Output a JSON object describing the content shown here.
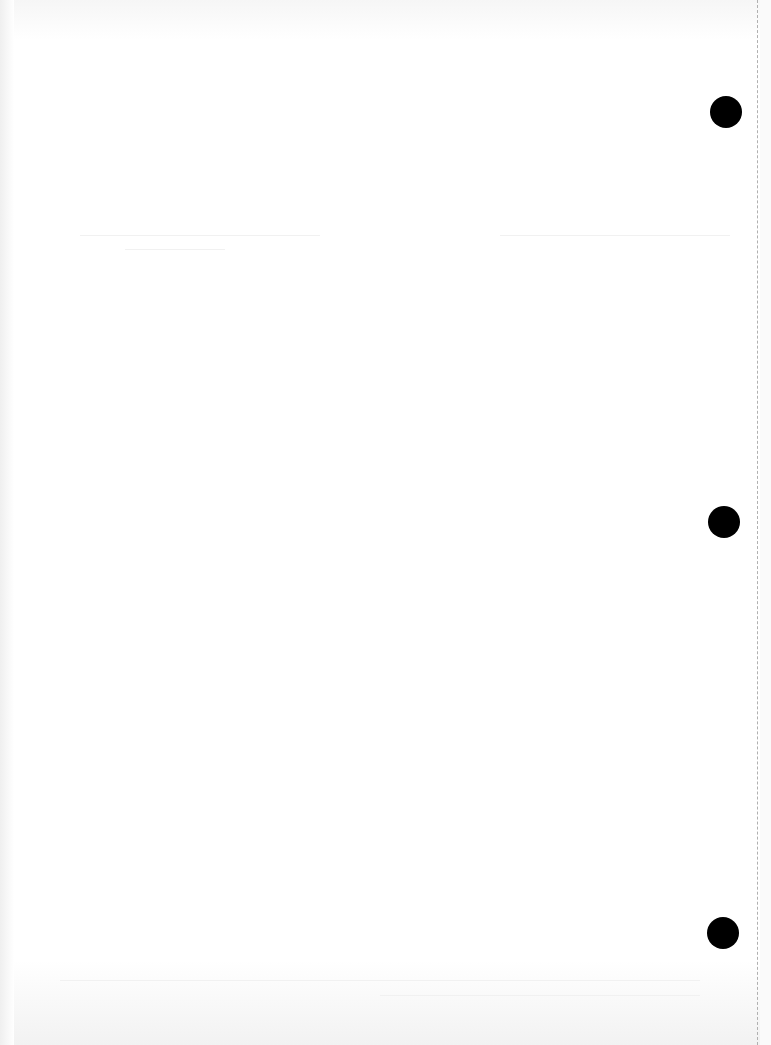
{
  "document": {
    "type": "blank scanned page",
    "text_content": "",
    "punch_holes": [
      {
        "cx": 726,
        "cy": 112
      },
      {
        "cx": 724,
        "cy": 522
      },
      {
        "cx": 723,
        "cy": 933
      }
    ],
    "hole_color": "#000000",
    "paper_color": "#ffffff",
    "perforation_color": "#b0b0b0"
  }
}
